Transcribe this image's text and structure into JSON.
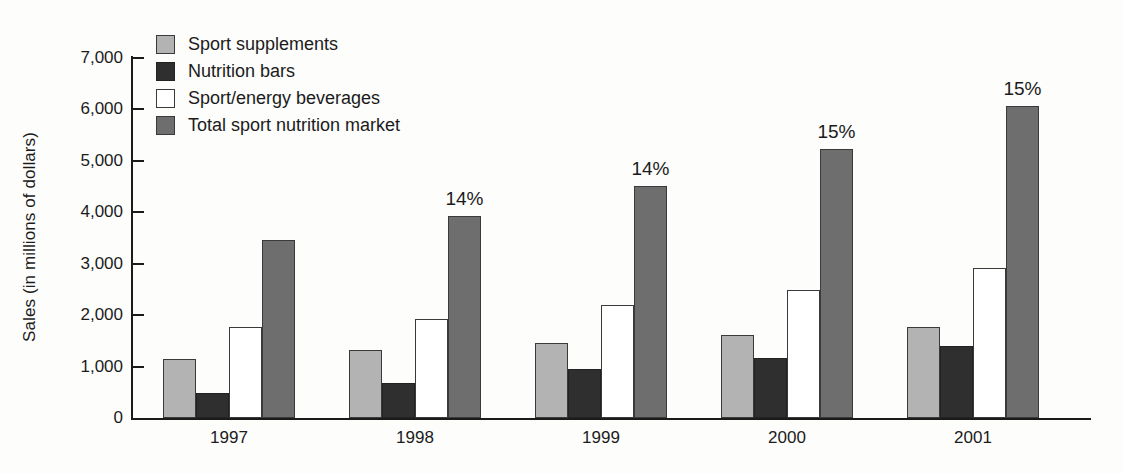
{
  "chart_data": {
    "type": "bar",
    "title": "",
    "xlabel": "",
    "ylabel": "Sales (in millions of dollars)",
    "categories": [
      "1997",
      "1998",
      "1999",
      "2000",
      "2001"
    ],
    "ylim": [
      0,
      7000
    ],
    "yticks": [
      0,
      1000,
      2000,
      3000,
      4000,
      5000,
      6000,
      7000
    ],
    "ytick_labels": [
      "0",
      "1,000",
      "2,000",
      "3,000",
      "4,000",
      "5,000",
      "6,000",
      "7,000"
    ],
    "grid": false,
    "legend_position": "top-left",
    "series": [
      {
        "name": "Sport supplements",
        "color": "#b3b3b3",
        "values": [
          1150,
          1320,
          1450,
          1620,
          1760
        ]
      },
      {
        "name": "Nutrition bars",
        "color": "#2f2f2f",
        "values": [
          490,
          680,
          950,
          1170,
          1400
        ]
      },
      {
        "name": "Sport/energy beverages",
        "color": "#ffffff",
        "values": [
          1770,
          1925,
          2200,
          2490,
          2920
        ]
      },
      {
        "name": "Total sport nutrition market",
        "color": "#6e6e6e",
        "values": [
          3460,
          3930,
          4510,
          5240,
          6060
        ]
      }
    ],
    "annotations": [
      {
        "category": "1997",
        "series": "Total sport nutrition market",
        "text": ""
      },
      {
        "category": "1998",
        "series": "Total sport nutrition market",
        "text": "14%"
      },
      {
        "category": "1999",
        "series": "Total sport nutrition market",
        "text": "14%"
      },
      {
        "category": "2000",
        "series": "Total sport nutrition market",
        "text": "15%"
      },
      {
        "category": "2001",
        "series": "Total sport nutrition market",
        "text": "15%"
      }
    ]
  },
  "legend": {
    "items": [
      {
        "label": "Sport supplements"
      },
      {
        "label": "Nutrition bars"
      },
      {
        "label": "Sport/energy beverages"
      },
      {
        "label": "Total sport nutrition market"
      }
    ]
  },
  "axis": {
    "y_title": "Sales (in millions of dollars)"
  }
}
